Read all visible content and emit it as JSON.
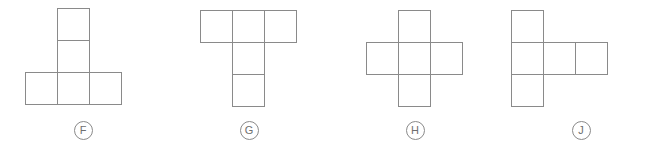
{
  "page": {
    "background_color": "#ffffff",
    "stroke_color": "#8a8a8a",
    "label_text_color": "#6e6e6e",
    "cell_size_px": 32,
    "stroke_width_px": 1
  },
  "options": [
    {
      "label": "F",
      "net_name": "t-shape-net",
      "description": "T-shaped net: one square on top, one square beneath it, and a horizontal row of three squares at the bottom",
      "square_count": 5,
      "grid_columns": 3,
      "grid_rows": 3,
      "cells": [
        {
          "col": 1,
          "row": 0
        },
        {
          "col": 1,
          "row": 1
        },
        {
          "col": 0,
          "row": 2
        },
        {
          "col": 1,
          "row": 2
        },
        {
          "col": 2,
          "row": 2
        }
      ],
      "offset_x": 25,
      "offset_y": 8
    },
    {
      "label": "G",
      "net_name": "inverted-t-shape-net",
      "description": "Inverted T-shaped net: a horizontal row of three squares on top, with two squares extending downward from the middle column",
      "square_count": 5,
      "grid_columns": 3,
      "grid_rows": 3,
      "cells": [
        {
          "col": 0,
          "row": 0
        },
        {
          "col": 1,
          "row": 0
        },
        {
          "col": 2,
          "row": 0
        },
        {
          "col": 1,
          "row": 1
        },
        {
          "col": 1,
          "row": 2
        }
      ],
      "offset_x": 34,
      "offset_y": 10
    },
    {
      "label": "H",
      "net_name": "plus-cross-shape-net",
      "description": "Plus/cross-shaped net: a vertical column of three squares crossed by a horizontal row of three squares sharing the center square",
      "square_count": 5,
      "grid_columns": 3,
      "grid_rows": 3,
      "cells": [
        {
          "col": 1,
          "row": 0
        },
        {
          "col": 0,
          "row": 1
        },
        {
          "col": 1,
          "row": 1
        },
        {
          "col": 2,
          "row": 1
        },
        {
          "col": 1,
          "row": 2
        }
      ],
      "offset_x": 34,
      "offset_y": 10
    },
    {
      "label": "J",
      "net_name": "offset-l-shape-net",
      "description": "Net with a vertical column of three squares on the left and two squares extending to the right from the middle row",
      "square_count": 5,
      "grid_columns": 3,
      "grid_rows": 3,
      "cells": [
        {
          "col": 0,
          "row": 0
        },
        {
          "col": 0,
          "row": 1
        },
        {
          "col": 1,
          "row": 1
        },
        {
          "col": 2,
          "row": 1
        },
        {
          "col": 0,
          "row": 2
        }
      ],
      "offset_x": 13,
      "offset_y": 10
    }
  ]
}
